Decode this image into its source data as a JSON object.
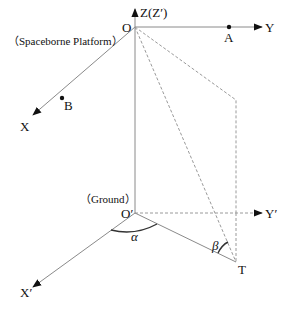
{
  "diagram": {
    "colors": {
      "line": "#8a8a8a",
      "dashed": "#9a9a9a",
      "arrow": "#111111",
      "text": "#111111"
    },
    "platform": {
      "label": "（Spaceborne Platform）",
      "origin_label": "O",
      "z_axis_label": "Z(Z′)",
      "y_axis_label": "Y",
      "x_axis_label": "X",
      "point_a_label": "A",
      "point_b_label": "B"
    },
    "ground": {
      "label": "（Ground）",
      "origin_label": "O′",
      "y_axis_label": "Y′",
      "x_axis_label": "X′",
      "target_label": "T"
    },
    "angles": {
      "alpha": "α",
      "beta": "β"
    }
  }
}
